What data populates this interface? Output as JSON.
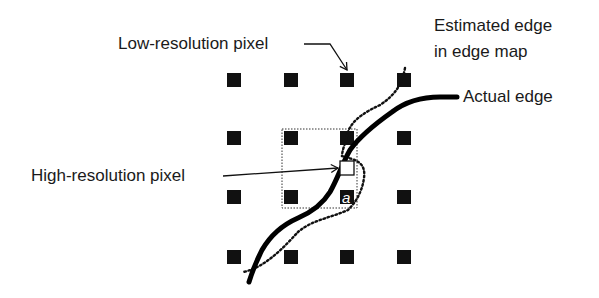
{
  "labels": {
    "low_res": "Low-resolution pixel",
    "high_res": "High-resolution pixel",
    "estimated_edge_line1": "Estimated edge",
    "estimated_edge_line2": "in edge map",
    "actual_edge": "Actual edge",
    "pixel_a": "a"
  },
  "grid": {
    "columns": [
      227,
      284,
      340,
      397
    ],
    "rows": [
      73,
      131,
      190,
      250
    ],
    "square_size": 14,
    "color": "#111111"
  },
  "colors": {
    "text": "#1a1a1a",
    "edge": "#000000",
    "background": "#ffffff"
  }
}
